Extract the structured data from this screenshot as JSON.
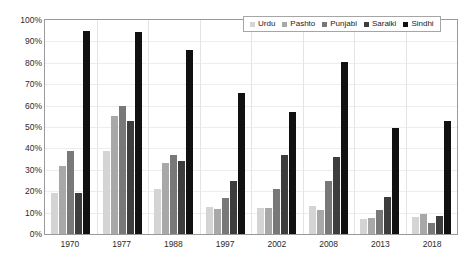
{
  "chart_data": {
    "type": "bar",
    "title": "",
    "subtitle": "",
    "xlabel": "",
    "ylabel": "",
    "ylim": [
      0,
      100
    ],
    "yticks": [
      "0%",
      "10%",
      "20%",
      "30%",
      "40%",
      "50%",
      "60%",
      "70%",
      "80%",
      "90%",
      "100%"
    ],
    "ytick_values": [
      0,
      10,
      20,
      30,
      40,
      50,
      60,
      70,
      80,
      90,
      100
    ],
    "grid": true,
    "legend_position": "top-right",
    "categories": [
      "1970",
      "1977",
      "1988",
      "1997",
      "2002",
      "2008",
      "2013",
      "2018"
    ],
    "series": [
      {
        "name": "Urdu",
        "color": "#d4d4d4",
        "values": [
          19,
          39,
          21,
          12.5,
          12,
          13,
          7,
          8
        ]
      },
      {
        "name": "Pashto",
        "color": "#a8a8a8",
        "values": [
          32,
          55,
          33,
          11.5,
          12,
          11,
          7.5,
          9.5
        ]
      },
      {
        "name": "Punjabi",
        "color": "#787878",
        "values": [
          39,
          60,
          37,
          17,
          21,
          25,
          11,
          5
        ]
      },
      {
        "name": "Saraiki",
        "color": "#3d3d3d",
        "values": [
          19,
          53,
          34,
          25,
          37,
          36,
          17.5,
          8.5
        ]
      },
      {
        "name": "Sindhi",
        "color": "#111111",
        "values": [
          95,
          94.5,
          86,
          66,
          57,
          80.5,
          49.5,
          53
        ]
      }
    ]
  }
}
